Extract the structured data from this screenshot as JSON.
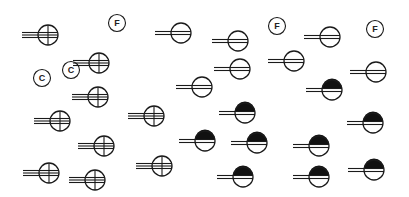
{
  "diagram": {
    "type": "station-model-symbols",
    "colors": {
      "stroke": "#1a1a1a",
      "fill": "#111111",
      "background": "#ffffff"
    },
    "labels": [
      {
        "text": "F",
        "x": 117,
        "y": 23
      },
      {
        "text": "F",
        "x": 277,
        "y": 26
      },
      {
        "text": "F",
        "x": 375,
        "y": 29
      },
      {
        "text": "C",
        "x": 42,
        "y": 78
      },
      {
        "text": "C",
        "x": 71,
        "y": 70
      }
    ],
    "symbols": [
      {
        "kind": "quartered",
        "x": 48,
        "y": 35
      },
      {
        "kind": "quartered",
        "x": 99,
        "y": 63
      },
      {
        "kind": "quartered",
        "x": 98,
        "y": 97
      },
      {
        "kind": "quartered",
        "x": 60,
        "y": 121
      },
      {
        "kind": "quartered",
        "x": 154,
        "y": 116
      },
      {
        "kind": "quartered",
        "x": 104,
        "y": 146
      },
      {
        "kind": "quartered",
        "x": 49,
        "y": 173
      },
      {
        "kind": "quartered",
        "x": 95,
        "y": 180
      },
      {
        "kind": "quartered",
        "x": 162,
        "y": 166
      },
      {
        "kind": "striped",
        "x": 181,
        "y": 33
      },
      {
        "kind": "striped",
        "x": 238,
        "y": 41
      },
      {
        "kind": "striped",
        "x": 330,
        "y": 37
      },
      {
        "kind": "striped",
        "x": 240,
        "y": 69
      },
      {
        "kind": "striped",
        "x": 294,
        "y": 61
      },
      {
        "kind": "striped",
        "x": 202,
        "y": 87
      },
      {
        "kind": "striped",
        "x": 376,
        "y": 72
      },
      {
        "kind": "half-filled",
        "x": 332,
        "y": 90
      },
      {
        "kind": "half-filled",
        "x": 245,
        "y": 113
      },
      {
        "kind": "half-filled",
        "x": 205,
        "y": 141
      },
      {
        "kind": "half-filled",
        "x": 257,
        "y": 143
      },
      {
        "kind": "half-filled",
        "x": 319,
        "y": 146
      },
      {
        "kind": "half-filled",
        "x": 373,
        "y": 123
      },
      {
        "kind": "half-filled",
        "x": 243,
        "y": 177
      },
      {
        "kind": "half-filled",
        "x": 319,
        "y": 177
      },
      {
        "kind": "half-filled",
        "x": 374,
        "y": 170
      }
    ],
    "symbol_radius": 10,
    "tail_length": 16
  }
}
